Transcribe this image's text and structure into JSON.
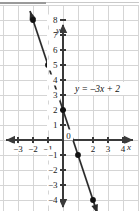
{
  "figure": {
    "background_color": "#ffffff",
    "grid_color": "#d5d5d5",
    "axis_color": "#3a3a3a",
    "line_color": "#2b2b2b",
    "point_color": "#111111",
    "text_color": "#1a1a1a"
  },
  "axes": {
    "x_label": "x",
    "y_label": "y",
    "origin_label": "0",
    "x_ticks": [
      {
        "value": -3,
        "label": "−3"
      },
      {
        "value": -2,
        "label": "−2"
      },
      {
        "value": -1,
        "label": "−1"
      },
      {
        "value": 2,
        "label": "2"
      },
      {
        "value": 3,
        "label": "3"
      },
      {
        "value": 4,
        "label": "4"
      }
    ],
    "y_ticks": [
      {
        "value": 8,
        "label": "8"
      },
      {
        "value": 7,
        "label": "7"
      },
      {
        "value": 6,
        "label": "6"
      },
      {
        "value": 5,
        "label": "5"
      },
      {
        "value": 4,
        "label": "4"
      },
      {
        "value": 3,
        "label": "3"
      },
      {
        "value": 2,
        "label": "2"
      },
      {
        "value": 1,
        "label": "1"
      },
      {
        "value": -1,
        "label": "−1"
      },
      {
        "value": -2,
        "label": "−2"
      },
      {
        "value": -3,
        "label": "−3"
      },
      {
        "value": -4,
        "label": "−4"
      }
    ]
  },
  "annotation": {
    "equation": "y = –3x + 2"
  },
  "chart_data": {
    "type": "line",
    "title": "",
    "subtitle": "",
    "xlabel": "x",
    "ylabel": "y",
    "xlim": [
      -3.6,
      4.6
    ],
    "ylim": [
      -4.8,
      8.8
    ],
    "grid": true,
    "legend": "none",
    "equation": "y = -3x + 2",
    "slope": -3,
    "intercept": 2,
    "annotations": [
      {
        "text": "y = –3x + 2",
        "x": 1.0,
        "y": 3.4
      }
    ],
    "series": [
      {
        "name": "y = -3x + 2",
        "color": "#2b2b2b",
        "arrow_start": true,
        "arrow_end": true,
        "x": [
          -2.2,
          2.3
        ],
        "y": [
          8.6,
          -4.9
        ],
        "points": [
          {
            "x": -2,
            "y": 8
          },
          {
            "x": -1,
            "y": 5
          },
          {
            "x": 0,
            "y": 2
          },
          {
            "x": 1,
            "y": -1
          },
          {
            "x": 2,
            "y": -4
          }
        ]
      }
    ]
  }
}
